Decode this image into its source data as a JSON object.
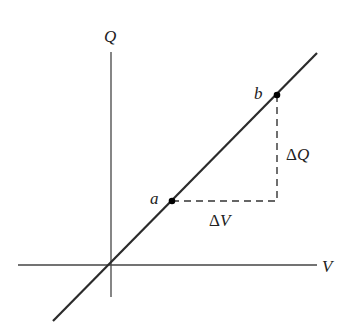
{
  "diagram": {
    "axes": {
      "y_label": "Q",
      "x_label": "V"
    },
    "points": [
      {
        "label": "a",
        "x": 172,
        "y": 201
      },
      {
        "label": "b",
        "x": 277,
        "y": 95
      }
    ],
    "delta_labels": {
      "dQ_symbol": "Δ",
      "dQ_var": "Q",
      "dV_symbol": "Δ",
      "dV_var": "V"
    },
    "colors": {
      "line": "#2b2b2b",
      "axis": "#444444",
      "dash": "#333333",
      "point": "#000000"
    }
  }
}
